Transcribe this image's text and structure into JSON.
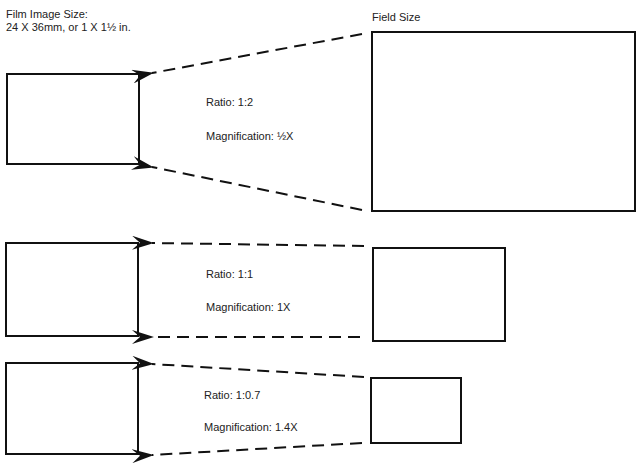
{
  "header": {
    "film_label_line1": "Film Image Size:",
    "film_label_line2": "24 X 36mm, or 1 X 1½ in.",
    "field_label": "Field Size"
  },
  "rows": [
    {
      "ratio": "Ratio: 1:2",
      "magnification": "Magnification: ½X"
    },
    {
      "ratio": "Ratio: 1:1",
      "magnification": "Magnification: 1X"
    },
    {
      "ratio": "Ratio: 1:0.7",
      "magnification": "Magnification: 1.4X"
    }
  ],
  "colors": {
    "line": "#111111",
    "text": "#222222",
    "background": "#ffffff"
  }
}
